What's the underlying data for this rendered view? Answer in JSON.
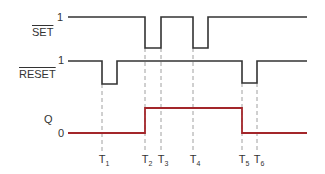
{
  "diagram": {
    "type": "timing-diagram",
    "signals": [
      {
        "name": "SET",
        "inverted": true,
        "high_label": "1",
        "color": "#333333",
        "transitions": [
          {
            "t": "T2",
            "to": 0
          },
          {
            "t": "T3",
            "to": 1
          },
          {
            "t": "T4",
            "to": 0
          },
          {
            "t": "T4_end",
            "to": 1
          }
        ]
      },
      {
        "name": "RESET",
        "inverted": true,
        "high_label": "1",
        "color": "#333333",
        "transitions": [
          {
            "t": "T1",
            "to": 0
          },
          {
            "t": "T1_end",
            "to": 1
          },
          {
            "t": "T5",
            "to": 0
          },
          {
            "t": "T6",
            "to": 1
          }
        ]
      },
      {
        "name": "Q",
        "inverted": false,
        "low_label": "0",
        "color": "#a3262a",
        "transitions": [
          {
            "t": "T2",
            "to": 1
          },
          {
            "t": "T5",
            "to": 0
          }
        ]
      }
    ],
    "time_markers": [
      {
        "label": "T",
        "sub": "1"
      },
      {
        "label": "T",
        "sub": "2"
      },
      {
        "label": "T",
        "sub": "3"
      },
      {
        "label": "T",
        "sub": "4"
      },
      {
        "label": "T",
        "sub": "5"
      },
      {
        "label": "T",
        "sub": "6"
      }
    ]
  },
  "labels": {
    "set": "SET",
    "reset": "RESET",
    "q": "Q",
    "one_set": "1",
    "one_reset": "1",
    "zero_q": "0"
  }
}
